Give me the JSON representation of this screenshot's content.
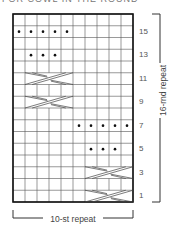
{
  "title": "FOR COWL IN THE ROUND",
  "chart": {
    "columns": 10,
    "rows": 16,
    "row_labels": [
      "15",
      "13",
      "11",
      "9",
      "7",
      "5",
      "3",
      "1"
    ],
    "purl_dots": [
      {
        "row": 15,
        "cols": [
          1,
          2,
          3,
          4,
          5
        ]
      },
      {
        "row": 13,
        "cols": [
          2,
          3,
          4
        ]
      },
      {
        "row": 7,
        "cols": [
          6,
          7,
          8,
          9,
          10
        ]
      },
      {
        "row": 5,
        "cols": [
          7,
          8,
          9
        ]
      }
    ],
    "cables": [
      {
        "row": 11,
        "cols": [
          2,
          5
        ]
      },
      {
        "row": 9,
        "cols": [
          2,
          5
        ]
      },
      {
        "row": 3,
        "cols": [
          7,
          10
        ]
      },
      {
        "row": 1,
        "cols": [
          7,
          10
        ]
      }
    ]
  },
  "labels": {
    "row_repeat": "16-rnd repeat",
    "stitch_repeat": "10-st repeat"
  }
}
